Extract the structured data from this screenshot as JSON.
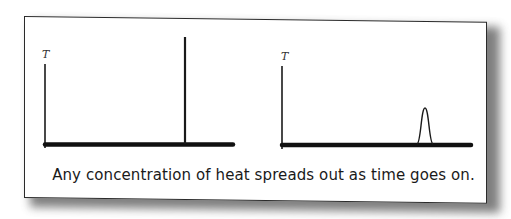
{
  "figure": {
    "caption": "Any concentration of heat spreads out as time goes on.",
    "panels": [
      {
        "id": "initial",
        "y_axis_label": "T",
        "description": "Delta spike of temperature at a single point"
      },
      {
        "id": "later",
        "y_axis_label": "T",
        "description": "Narrow bell-shaped temperature bump after diffusion begins"
      }
    ],
    "colors": {
      "ink": "#1a1a1a",
      "paper": "#ffffff",
      "shadow": "#555555"
    }
  }
}
